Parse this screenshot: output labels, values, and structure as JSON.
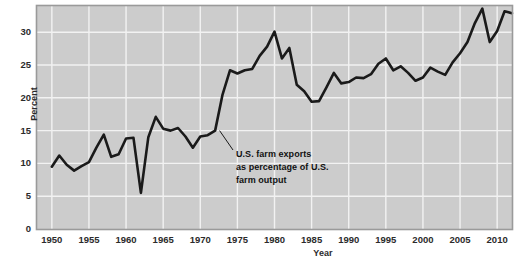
{
  "chart_data": {
    "type": "line",
    "title": "",
    "xlabel": "Year",
    "ylabel": "Percent",
    "xlim": [
      1948,
      2012
    ],
    "ylim": [
      0,
      34
    ],
    "yticks": [
      0,
      5,
      10,
      15,
      20,
      25,
      30
    ],
    "ytick_labels": [
      "0",
      "5",
      "10",
      "15",
      "20",
      "25",
      "30"
    ],
    "xticks": [
      1950,
      1955,
      1960,
      1965,
      1970,
      1975,
      1980,
      1985,
      1990,
      1995,
      2000,
      2005,
      2010
    ],
    "xtick_labels": [
      "1950",
      "1955",
      "1960",
      "1965",
      "1970",
      "1975",
      "1980",
      "1985",
      "1990",
      "1995",
      "2000",
      "2005",
      "2010"
    ],
    "grid": true,
    "legend": "none",
    "series": [
      {
        "name": "U.S. farm exports as percentage of U.S. farm output",
        "x": [
          1950,
          1951,
          1952,
          1953,
          1954,
          1955,
          1956,
          1957,
          1958,
          1959,
          1960,
          1961,
          1962,
          1963,
          1964,
          1965,
          1966,
          1967,
          1968,
          1969,
          1970,
          1971,
          1972,
          1973,
          1974,
          1975,
          1976,
          1977,
          1978,
          1979,
          1980,
          1981,
          1982,
          1983,
          1984,
          1985,
          1986,
          1987,
          1988,
          1989,
          1990,
          1991,
          1992,
          1993,
          1994,
          1995,
          1996,
          1997,
          1998,
          1999,
          2000,
          2001,
          2002,
          2003,
          2004,
          2005,
          2006,
          2007,
          2008,
          2009,
          2010,
          2011,
          2012
        ],
        "y": [
          9.5,
          11.2,
          9.8,
          8.9,
          9.6,
          10.2,
          12.4,
          14.4,
          11.0,
          11.4,
          13.8,
          13.9,
          5.5,
          14.0,
          17.1,
          15.3,
          15.0,
          15.4,
          14.1,
          12.4,
          14.1,
          14.3,
          15.0,
          20.5,
          24.2,
          23.7,
          24.2,
          24.4,
          26.4,
          27.8,
          30.1,
          26.0,
          27.6,
          22.0,
          21.0,
          19.4,
          19.5,
          21.6,
          23.8,
          22.2,
          22.4,
          23.1,
          23.0,
          23.6,
          25.2,
          26.0,
          24.2,
          24.8,
          23.8,
          22.6,
          23.1,
          24.6,
          24.0,
          23.5,
          25.4,
          26.8,
          28.5,
          31.4,
          33.6,
          28.5,
          30.2,
          33.2,
          32.9
        ]
      }
    ],
    "annotations": [
      {
        "lines": [
          "U.S. farm exports",
          "as percentage of U.S.",
          "farm output"
        ],
        "pointer_from": [
          1972.6,
          15.0
        ]
      }
    ],
    "colors": {
      "plot_background": "#cccccc",
      "gridline": "#f2f2f2",
      "line": "#1a1a1a",
      "text": "#2b2b2b",
      "page_background": "#ffffff",
      "frame": "#9a9a9a"
    }
  }
}
